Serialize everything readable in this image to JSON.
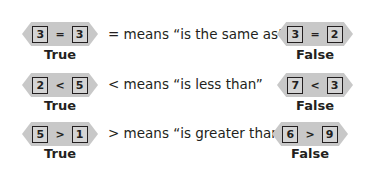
{
  "rows": [
    {
      "meaning": "= means “is the same as”",
      "true_example": {
        "left": "3",
        "op": "=",
        "right": "3",
        "verdict": "True"
      },
      "false_example": {
        "left": "3",
        "op": "=",
        "right": "2",
        "verdict": "False"
      }
    },
    {
      "meaning": "< means “is less than”",
      "true_example": {
        "left": "2",
        "op": "<",
        "right": "5",
        "verdict": "True"
      },
      "false_example": {
        "left": "7",
        "op": "<",
        "right": "3",
        "verdict": "False"
      }
    },
    {
      "meaning": "> means “is greater than”",
      "true_example": {
        "left": "5",
        "op": ">",
        "right": "1",
        "verdict": "True"
      },
      "false_example": {
        "left": "6",
        "op": ">",
        "right": "9",
        "verdict": "False"
      }
    }
  ],
  "colors": {
    "hexagon_fill": "#c8c8c8",
    "text": "#231f20"
  }
}
